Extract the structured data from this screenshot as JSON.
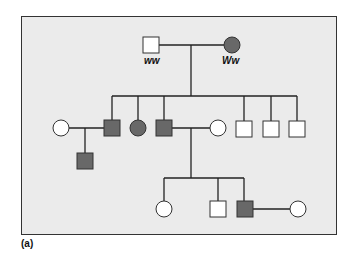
{
  "panel_label": "(a)",
  "colors": {
    "background": "#ebebeb",
    "affected": "#686868",
    "unaffected": "#ffffff",
    "line": "#222222"
  },
  "legend": {
    "symbols": {
      "square": "male",
      "circle": "female",
      "filled": "affected",
      "open": "unaffected"
    }
  },
  "generation_I": {
    "father": {
      "sex": "male",
      "affected": false,
      "genotype": "ww"
    },
    "mother": {
      "sex": "female",
      "affected": true,
      "genotype": "Ww"
    }
  },
  "generation_II": {
    "children": [
      {
        "sex": "male",
        "affected": true,
        "spouse": {
          "sex": "female",
          "affected": false
        },
        "offspring": [
          {
            "sex": "male",
            "affected": true
          }
        ]
      },
      {
        "sex": "female",
        "affected": true
      },
      {
        "sex": "male",
        "affected": true,
        "spouse": {
          "sex": "female",
          "affected": false
        }
      },
      {
        "sex": "male",
        "affected": false
      },
      {
        "sex": "male",
        "affected": false
      },
      {
        "sex": "male",
        "affected": false
      }
    ]
  },
  "generation_III": {
    "children": [
      {
        "sex": "female",
        "affected": false
      },
      {
        "sex": "male",
        "affected": false
      },
      {
        "sex": "male",
        "affected": true,
        "spouse": {
          "sex": "female",
          "affected": false
        }
      }
    ]
  }
}
